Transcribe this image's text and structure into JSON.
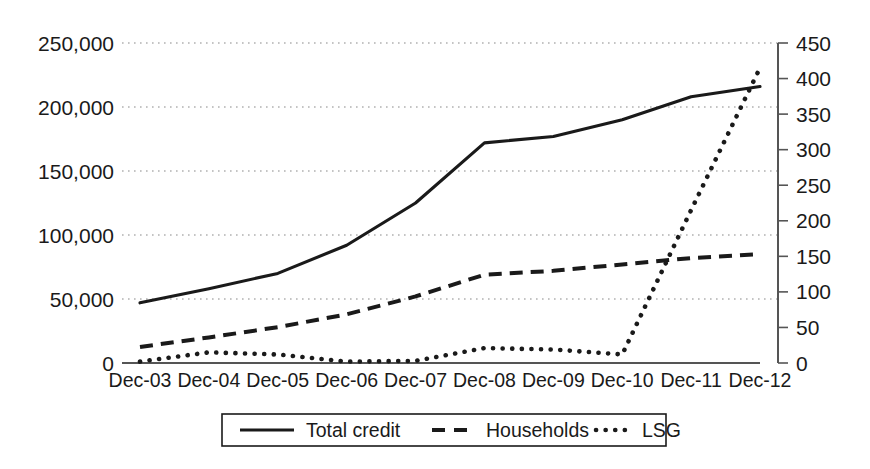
{
  "chart_data": {
    "type": "line",
    "title": "",
    "subtitle": "",
    "xlabel": "",
    "ylabel": "",
    "grid": true,
    "legend_position": "bottom",
    "categories": [
      "Dec-03",
      "Dec-04",
      "Dec-05",
      "Dec-06",
      "Dec-07",
      "Dec-08",
      "Dec-09",
      "Dec-10",
      "Dec-11",
      "Dec-12"
    ],
    "left_axis": {
      "label": "",
      "ticks": [
        "0",
        "50,000",
        "100,000",
        "150,000",
        "200,000",
        "250,000"
      ],
      "tick_values": [
        0,
        50000,
        100000,
        150000,
        200000,
        250000
      ],
      "ylim": [
        0,
        250000
      ]
    },
    "right_axis": {
      "label": "",
      "ticks": [
        "0",
        "50",
        "100",
        "150",
        "200",
        "250",
        "300",
        "350",
        "400",
        "450"
      ],
      "tick_values": [
        0,
        50,
        100,
        150,
        200,
        250,
        300,
        350,
        400,
        450
      ],
      "ylim": [
        0,
        450
      ]
    },
    "series": [
      {
        "name": "Total credit",
        "axis": "left",
        "style": "solid",
        "color": "#1a1a1a",
        "values": [
          47000,
          58000,
          70000,
          92000,
          125000,
          172000,
          177000,
          190000,
          208000,
          216000
        ]
      },
      {
        "name": "Households",
        "axis": "left",
        "style": "dashed",
        "color": "#1a1a1a",
        "values": [
          12500,
          20000,
          28000,
          38000,
          52000,
          69000,
          72000,
          77000,
          82000,
          85000
        ]
      },
      {
        "name": "LSG",
        "axis": "right",
        "style": "dotted",
        "color": "#1a1a1a",
        "values": [
          2,
          15,
          12,
          2,
          3,
          21,
          19,
          12,
          215,
          415
        ]
      }
    ],
    "legend": [
      {
        "label": "Total credit",
        "style": "solid"
      },
      {
        "label": "Households",
        "style": "dashed"
      },
      {
        "label": "LSG",
        "style": "dotted"
      }
    ]
  }
}
